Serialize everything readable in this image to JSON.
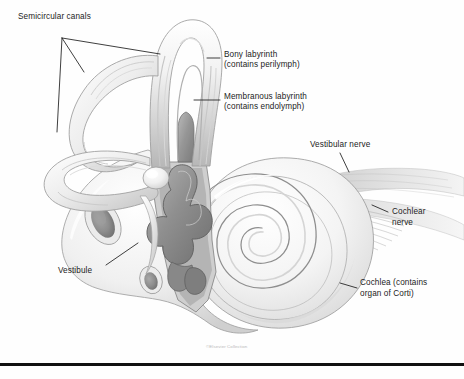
{
  "figure": {
    "background_color": "#fefefe",
    "ink_color": "#1c1c1c",
    "credit": "©Elsevier Collection"
  },
  "labels": [
    {
      "id": "semicircular-canals",
      "text": "Semicircular canals",
      "x": 18,
      "y": 16
    },
    {
      "id": "bony-labyrinth-line1",
      "text": "Bony labyrinth",
      "x": 224,
      "y": 54
    },
    {
      "id": "bony-labyrinth-line2",
      "text": "(contains perilymph)",
      "x": 224,
      "y": 64
    },
    {
      "id": "membranous-labyrinth-line1",
      "text": "Membranous labyrinth",
      "x": 224,
      "y": 93
    },
    {
      "id": "membranous-labyrinth-line2",
      "text": "(contains endolymph)",
      "x": 224,
      "y": 103
    },
    {
      "id": "vestibular-nerve",
      "text": "Vestibular nerve",
      "x": 310,
      "y": 141
    },
    {
      "id": "cochlear-nerve-line1",
      "text": "Cochlear",
      "x": 392,
      "y": 210
    },
    {
      "id": "cochlear-nerve-line2",
      "text": "nerve",
      "x": 392,
      "y": 221
    },
    {
      "id": "vestibule",
      "text": "Vestibule",
      "x": 58,
      "y": 270
    },
    {
      "id": "cochlea-line1",
      "text": "Cochlea (contains",
      "x": 360,
      "y": 281
    },
    {
      "id": "cochlea-line2",
      "text": "organ of Corti)",
      "x": 360,
      "y": 292
    }
  ],
  "structures": [
    {
      "id": "superior-semicircular-canal",
      "name": "Superior semicircular canal"
    },
    {
      "id": "posterior-semicircular-canal",
      "name": "Posterior semicircular canal"
    },
    {
      "id": "lateral-semicircular-canal",
      "name": "Lateral semicircular canal"
    },
    {
      "id": "vestibule-chamber",
      "name": "Vestibule"
    },
    {
      "id": "cochlea-spiral",
      "name": "Cochlea"
    },
    {
      "id": "membranous-labyrinth-core",
      "name": "Membranous labyrinth"
    },
    {
      "id": "vestibulocochlear-nerve",
      "name": "Vestibulocochlear nerve bundle"
    },
    {
      "id": "oval-window",
      "name": "Oval window"
    },
    {
      "id": "round-window",
      "name": "Round window"
    }
  ]
}
